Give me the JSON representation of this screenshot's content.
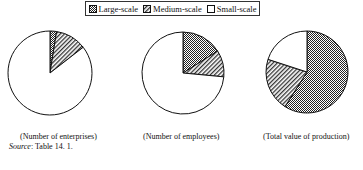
{
  "legend": {
    "items": [
      {
        "label": "Large-scale",
        "pattern": "crosshatch-dense"
      },
      {
        "label": "Medium-scale",
        "pattern": "diagonal-hatch"
      },
      {
        "label": "Small-scale",
        "pattern": "blank"
      }
    ]
  },
  "captions": [
    "(Number of enterprises)",
    "(Number of employees)",
    "(Total value of production)"
  ],
  "source": {
    "label": "Source",
    "text": ": Table 14. 1."
  },
  "chart_data": [
    {
      "type": "pie",
      "title": "(Number of enterprises)",
      "categories": [
        "Large-scale",
        "Medium-scale",
        "Small-scale"
      ],
      "values": [
        2.5,
        12,
        85.5
      ],
      "unit": "percent (estimated)",
      "start_angle": "12 o'clock, clockwise",
      "legend_position": "top"
    },
    {
      "type": "pie",
      "title": "(Number of employees)",
      "categories": [
        "Large-scale",
        "Medium-scale",
        "Small-scale"
      ],
      "values": [
        16,
        10.5,
        73.5
      ],
      "unit": "percent (estimated)",
      "start_angle": "12 o'clock, clockwise",
      "legend_position": "top"
    },
    {
      "type": "pie",
      "title": "(Total value of production)",
      "categories": [
        "Large-scale",
        "Medium-scale",
        "Small-scale"
      ],
      "values": [
        59,
        21,
        20
      ],
      "unit": "percent (estimated)",
      "start_angle": "12 o'clock, clockwise",
      "legend_position": "top"
    }
  ],
  "colors": {
    "stroke": "#111111",
    "background": "#ffffff"
  }
}
